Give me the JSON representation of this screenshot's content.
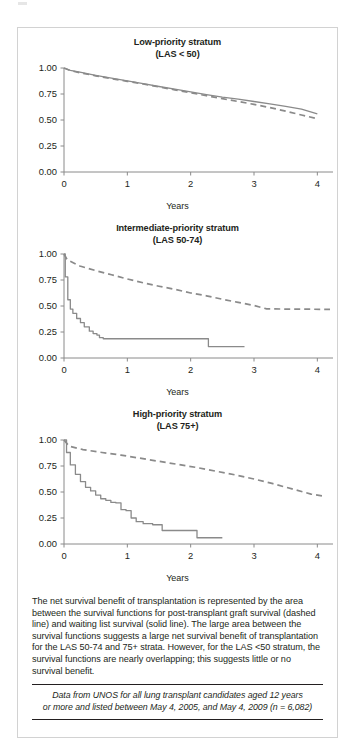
{
  "figure": {
    "panels": [
      {
        "id": "low-priority",
        "title": "Low-priority stratum",
        "subtitle": "(LAS < 50)",
        "xlabel": "Years"
      },
      {
        "id": "intermediate-priority",
        "title": "Intermediate-priority stratum",
        "subtitle": "(LAS 50-74)",
        "xlabel": "Years"
      },
      {
        "id": "high-priority",
        "title": "High-priority stratum",
        "subtitle": "(LAS 75+)",
        "xlabel": "Years"
      }
    ],
    "caption": "The net survival benefit of transplantation is represented by the area between the survival functions for post-transplant graft survival (dashed line) and waiting list survival (solid line). The large area between the survival functions suggests a large net survival benefit of transplantation for the LAS 50-74 and 75+ strata. However, for the LAS <50 stratum, the survival functions are nearly overlapping; this suggests little or no survival benefit.",
    "source_line1": "Data from UNOS for all lung transplant candidates aged 12 years",
    "source_line2": "or more and listed between May 4, 2005, and May 4, 2009 (n = 6,082)",
    "colors": {
      "line": "#8a8a8a",
      "axis": "#8a8a8a",
      "text": "#231f20",
      "border": "#d2d2d2"
    }
  },
  "chart_data": [
    {
      "type": "line",
      "id": "low-priority",
      "title": "Low-priority stratum",
      "subtitle": "(LAS < 50)",
      "xlabel": "Years",
      "ylabel": "",
      "xlim": [
        0,
        4.2
      ],
      "ylim": [
        0,
        1.0
      ],
      "xticks": [
        0,
        1,
        2,
        3,
        4
      ],
      "yticks": [
        0.0,
        0.25,
        0.5,
        0.75,
        1.0
      ],
      "ytick_labels": [
        "0.00",
        "0.25",
        "0.50",
        "0.75",
        "1.00"
      ],
      "grid": false,
      "legend": null,
      "series": [
        {
          "name": "post-transplant graft survival (dashed)",
          "style": "dashed",
          "x": [
            0,
            0.1,
            0.25,
            0.5,
            0.75,
            1.0,
            1.25,
            1.5,
            1.75,
            2.0,
            2.25,
            2.5,
            2.75,
            3.0,
            3.25,
            3.5,
            3.75,
            4.0
          ],
          "y": [
            1.0,
            0.975,
            0.955,
            0.925,
            0.898,
            0.872,
            0.846,
            0.818,
            0.79,
            0.762,
            0.733,
            0.705,
            0.678,
            0.65,
            0.62,
            0.585,
            0.548,
            0.512
          ]
        },
        {
          "name": "waiting list survival (solid)",
          "style": "solid",
          "x": [
            0,
            0.1,
            0.25,
            0.5,
            0.75,
            1.0,
            1.25,
            1.5,
            1.75,
            2.0,
            2.25,
            2.5,
            2.75,
            3.0,
            3.25,
            3.5,
            3.75,
            4.0
          ],
          "y": [
            1.0,
            0.978,
            0.96,
            0.93,
            0.902,
            0.876,
            0.85,
            0.822,
            0.796,
            0.77,
            0.744,
            0.72,
            0.7,
            0.678,
            0.655,
            0.63,
            0.605,
            0.56
          ]
        }
      ]
    },
    {
      "type": "line",
      "id": "intermediate-priority",
      "title": "Intermediate-priority stratum",
      "subtitle": "(LAS 50-74)",
      "xlabel": "Years",
      "ylabel": "",
      "xlim": [
        0,
        4.2
      ],
      "ylim": [
        0,
        1.0
      ],
      "xticks": [
        0,
        1,
        2,
        3,
        4
      ],
      "yticks": [
        0.0,
        0.25,
        0.5,
        0.75,
        1.0
      ],
      "ytick_labels": [
        "0.00",
        "0.25",
        "0.50",
        "0.75",
        "1.00"
      ],
      "grid": false,
      "legend": null,
      "series": [
        {
          "name": "post-transplant graft survival (dashed)",
          "style": "dashed",
          "x": [
            0,
            0.05,
            0.25,
            0.5,
            0.75,
            1.0,
            1.25,
            1.5,
            1.75,
            2.0,
            2.25,
            2.5,
            2.75,
            3.0,
            3.2,
            3.6,
            4.2
          ],
          "y": [
            1.0,
            0.945,
            0.885,
            0.84,
            0.8,
            0.76,
            0.723,
            0.69,
            0.66,
            0.625,
            0.598,
            0.565,
            0.535,
            0.505,
            0.472,
            0.47,
            0.468
          ]
        },
        {
          "name": "waiting list survival (solid)",
          "style": "solid",
          "x": [
            0,
            0.02,
            0.06,
            0.1,
            0.14,
            0.2,
            0.26,
            0.32,
            0.4,
            0.46,
            0.52,
            0.56,
            0.62,
            2.25,
            2.28,
            2.85
          ],
          "y": [
            1.0,
            0.78,
            0.56,
            0.47,
            0.43,
            0.38,
            0.34,
            0.3,
            0.258,
            0.235,
            0.22,
            0.195,
            0.185,
            0.185,
            0.11,
            0.11
          ]
        }
      ]
    },
    {
      "type": "line",
      "id": "high-priority",
      "title": "High-priority stratum",
      "subtitle": "(LAS 75+)",
      "xlabel": "Years",
      "ylabel": "",
      "xlim": [
        0,
        4.2
      ],
      "ylim": [
        0,
        1.0
      ],
      "xticks": [
        0,
        1,
        2,
        3,
        4
      ],
      "yticks": [
        0.0,
        0.25,
        0.5,
        0.75,
        1.0
      ],
      "ytick_labels": [
        "0.00",
        "0.25",
        "0.50",
        "0.75",
        "1.00"
      ],
      "grid": false,
      "legend": null,
      "series": [
        {
          "name": "post-transplant graft survival (dashed)",
          "style": "dashed",
          "x": [
            0,
            0.08,
            0.3,
            0.6,
            0.9,
            1.2,
            1.5,
            1.8,
            2.1,
            2.4,
            2.7,
            3.0,
            3.3,
            3.6,
            3.9,
            4.1
          ],
          "y": [
            1.0,
            0.94,
            0.908,
            0.88,
            0.855,
            0.825,
            0.795,
            0.765,
            0.735,
            0.7,
            0.665,
            0.625,
            0.58,
            0.53,
            0.48,
            0.46
          ]
        },
        {
          "name": "waiting list survival (solid)",
          "style": "solid",
          "x": [
            0,
            0.04,
            0.1,
            0.18,
            0.26,
            0.34,
            0.42,
            0.5,
            0.58,
            0.66,
            0.74,
            0.82,
            0.9,
            0.98,
            1.06,
            1.14,
            1.25,
            1.4,
            1.55,
            2.05,
            2.1,
            2.5
          ],
          "y": [
            1.0,
            0.88,
            0.76,
            0.67,
            0.6,
            0.545,
            0.51,
            0.47,
            0.435,
            0.42,
            0.4,
            0.395,
            0.33,
            0.32,
            0.25,
            0.215,
            0.195,
            0.185,
            0.13,
            0.13,
            0.06,
            0.06
          ]
        }
      ]
    }
  ]
}
